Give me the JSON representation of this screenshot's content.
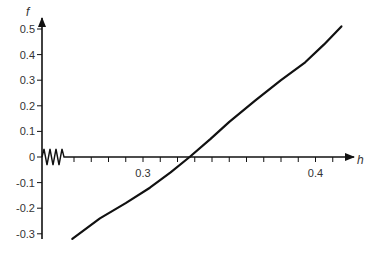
{
  "chart_data": {
    "type": "line",
    "title": "",
    "xlabel": "h",
    "ylabel": "f",
    "xlim": [
      0.24,
      0.42
    ],
    "ylim": [
      -0.32,
      0.52
    ],
    "grid": false,
    "legend": null,
    "axis_break": {
      "axis": "x",
      "position": "near origin",
      "style": "zigzag"
    },
    "x_ticks": [
      {
        "value": 0.26,
        "label": ""
      },
      {
        "value": 0.27,
        "label": ""
      },
      {
        "value": 0.28,
        "label": ""
      },
      {
        "value": 0.29,
        "label": ""
      },
      {
        "value": 0.3,
        "label": "0.3"
      },
      {
        "value": 0.31,
        "label": ""
      },
      {
        "value": 0.32,
        "label": ""
      },
      {
        "value": 0.33,
        "label": ""
      },
      {
        "value": 0.34,
        "label": ""
      },
      {
        "value": 0.35,
        "label": ""
      },
      {
        "value": 0.36,
        "label": ""
      },
      {
        "value": 0.37,
        "label": ""
      },
      {
        "value": 0.38,
        "label": ""
      },
      {
        "value": 0.39,
        "label": ""
      },
      {
        "value": 0.4,
        "label": "0.4"
      },
      {
        "value": 0.41,
        "label": ""
      }
    ],
    "y_ticks": [
      {
        "value": 0.5,
        "label": "0.5"
      },
      {
        "value": 0.4,
        "label": "0.4"
      },
      {
        "value": 0.3,
        "label": "0.3"
      },
      {
        "value": 0.2,
        "label": "0.2"
      },
      {
        "value": 0.1,
        "label": "0.1"
      },
      {
        "value": 0.0,
        "label": "0"
      },
      {
        "value": -0.1,
        "label": "-0.1"
      },
      {
        "value": -0.2,
        "label": "-0.2"
      },
      {
        "value": -0.3,
        "label": "-0.3"
      }
    ],
    "series": [
      {
        "name": "f(h)",
        "color": "#111111",
        "x": [
          0.259,
          0.275,
          0.29,
          0.304,
          0.316,
          0.327,
          0.339,
          0.35,
          0.365,
          0.38,
          0.394,
          0.405,
          0.415
        ],
        "y": [
          -0.32,
          -0.24,
          -0.18,
          -0.12,
          -0.06,
          0.0,
          0.07,
          0.137,
          0.22,
          0.3,
          0.37,
          0.44,
          0.51
        ]
      }
    ],
    "annotations": [
      {
        "text": "root crossing",
        "x": 0.327,
        "y": 0.0
      }
    ]
  }
}
